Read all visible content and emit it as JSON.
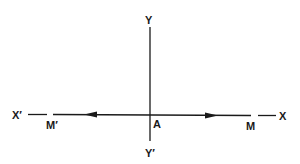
{
  "diagram": {
    "type": "axes-with-points",
    "colors": {
      "background": "#ffffff",
      "ink": "#1a1a1a"
    },
    "labels": {
      "y_top": "Y",
      "y_bottom": "Y′",
      "x_left": "X′",
      "x_right": "X",
      "origin": "A",
      "point_right": "M",
      "point_left": "M′"
    },
    "arrows": [
      {
        "from": "A",
        "toward": "M′",
        "direction": "left"
      },
      {
        "from": "A",
        "toward": "M",
        "direction": "right"
      }
    ]
  }
}
